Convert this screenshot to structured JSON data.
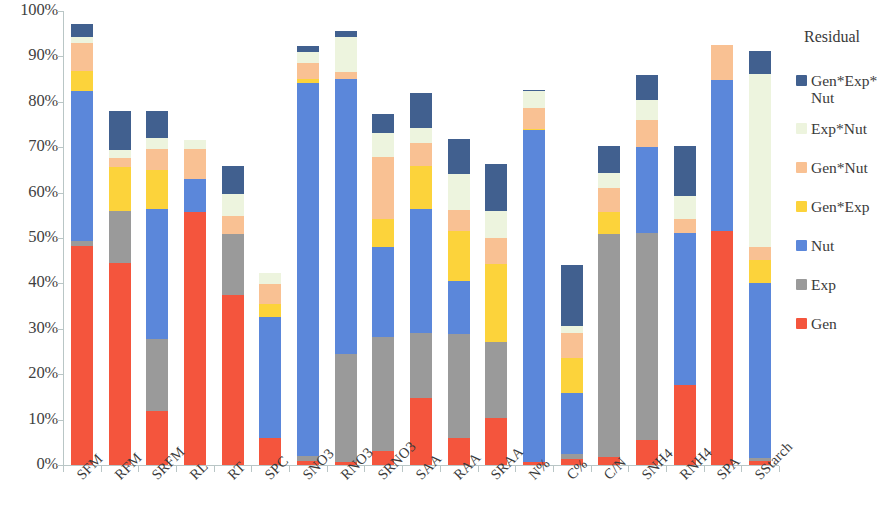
{
  "chart_data": {
    "type": "bar",
    "subtype": "stacked-bar-100-percent",
    "title": "",
    "xlabel": "",
    "ylabel": "",
    "ylim": [
      0,
      100
    ],
    "ytick_labels": [
      "0%",
      "10%",
      "20%",
      "30%",
      "40%",
      "50%",
      "60%",
      "70%",
      "80%",
      "90%",
      "100%"
    ],
    "ytick_values": [
      0,
      10,
      20,
      30,
      40,
      50,
      60,
      70,
      80,
      90,
      100
    ],
    "grid": false,
    "legend_position": "right",
    "legend_title": "Residual",
    "categories": [
      "SFM",
      "RFM",
      "SRFM",
      "RL",
      "RT",
      "SPC",
      "SNO3",
      "RNO3",
      "SRNO3",
      "SAA",
      "RAA",
      "SRAA",
      "N%",
      "C%",
      "C/N",
      "SNH4",
      "RNH4",
      "SPA",
      "SStarch"
    ],
    "series": [
      {
        "name": "Gen",
        "color": "#F4553D",
        "values": [
          48.2,
          44.5,
          11.8,
          55.8,
          37.5,
          6.0,
          0.8,
          0.6,
          3.0,
          14.8,
          6.0,
          10.4,
          0.7,
          1.3,
          1.8,
          5.6,
          17.6,
          51.5,
          0.8
        ]
      },
      {
        "name": "Exp",
        "color": "#9A9A9A",
        "values": [
          1.2,
          11.4,
          16.0,
          0.0,
          13.3,
          0.0,
          1.2,
          23.8,
          25.1,
          14.2,
          22.8,
          16.8,
          0.0,
          1.1,
          49.1,
          45.5,
          0.0,
          0.0,
          0.8
        ]
      },
      {
        "name": "Nut",
        "color": "#5B87DA",
        "values": [
          32.9,
          0.0,
          28.7,
          7.3,
          0.0,
          26.5,
          82.1,
          60.6,
          19.9,
          27.5,
          11.8,
          0.0,
          73.0,
          13.4,
          0.0,
          18.9,
          33.5,
          33.4,
          38.5
        ]
      },
      {
        "name": "Gen*Exp",
        "color": "#FCD33B",
        "values": [
          4.5,
          9.8,
          8.4,
          0.0,
          0.0,
          2.9,
          1.0,
          0.0,
          6.2,
          9.4,
          11.0,
          17.0,
          0.4,
          7.7,
          4.8,
          0.0,
          0.0,
          0.0,
          5.0
        ]
      },
      {
        "name": "Gen*Nut",
        "color": "#F9C193",
        "values": [
          6.2,
          2.0,
          4.7,
          6.4,
          4.0,
          4.4,
          3.4,
          1.5,
          13.7,
          5.0,
          4.5,
          5.8,
          4.6,
          5.6,
          5.4,
          6.0,
          3.1,
          7.6,
          3.0
        ]
      },
      {
        "name": "Exp*Nut",
        "color": "#EDF4DE",
        "values": [
          1.2,
          1.6,
          2.5,
          2.0,
          4.8,
          2.6,
          2.4,
          7.8,
          5.3,
          3.3,
          7.9,
          6.0,
          3.6,
          1.5,
          3.2,
          4.4,
          5.1,
          0.0,
          38.0
        ]
      },
      {
        "name": "Gen*Exp*Nut",
        "color": "#41608F",
        "values": [
          2.9,
          8.7,
          5.8,
          0.0,
          6.2,
          0.0,
          1.5,
          1.2,
          4.2,
          7.8,
          7.8,
          10.4,
          0.4,
          13.4,
          5.9,
          5.6,
          11.0,
          0.0,
          5.0
        ]
      }
    ],
    "bar_totals": [
      97.1,
      78.0,
      77.9,
      71.5,
      65.8,
      42.4,
      92.4,
      95.5,
      77.4,
      82.0,
      71.8,
      66.4,
      82.7,
      44.0,
      70.2,
      86.0,
      70.3,
      92.5,
      91.1
    ]
  },
  "legend": {
    "title": "Residual",
    "items": [
      {
        "label": "Gen*Exp*\nNut",
        "color": "#41608F"
      },
      {
        "label": "Exp*Nut",
        "color": "#EDF4DE"
      },
      {
        "label": "Gen*Nut",
        "color": "#F9C193"
      },
      {
        "label": "Gen*Exp",
        "color": "#FCD33B"
      },
      {
        "label": "Nut",
        "color": "#5B87DA"
      },
      {
        "label": "Exp",
        "color": "#9A9A9A"
      },
      {
        "label": "Gen",
        "color": "#F4553D"
      }
    ]
  },
  "axis": {
    "y_labels": [
      "100%",
      "90%",
      "80%",
      "70%",
      "60%",
      "50%",
      "40%",
      "30%",
      "20%",
      "10%",
      "0%"
    ],
    "x_labels": [
      "SFM",
      "RFM",
      "SRFM",
      "RL",
      "RT",
      "SPC",
      "SNO3",
      "RNO3",
      "SRNO3",
      "SAA",
      "RAA",
      "SRAA",
      "N%",
      "C%",
      "C/N",
      "SNH4",
      "RNH4",
      "SPA",
      "SStarch"
    ]
  }
}
